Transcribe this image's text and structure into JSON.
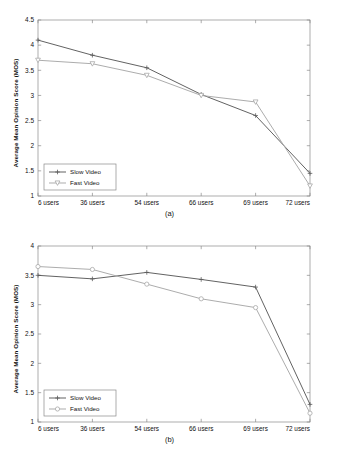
{
  "figure": {
    "background": "#ffffff",
    "width": 339,
    "height": 452
  },
  "chart_data": [
    {
      "type": "line",
      "panel_label": "(a)",
      "title": "",
      "xlabel": "",
      "ylabel": "Average Mean Opinion Score (MOS)",
      "categories": [
        "6 users",
        "36 users",
        "54 users",
        "66 users",
        "69 users",
        "72 users"
      ],
      "ylim": [
        1,
        4.5
      ],
      "yticks": [
        "1",
        "1.5",
        "2",
        "2.5",
        "3",
        "3.5",
        "4",
        "4.5"
      ],
      "ytick_values": [
        1,
        1.5,
        2,
        2.5,
        3,
        3.5,
        4,
        4.5
      ],
      "grid": false,
      "legend_position": "lower left",
      "series": [
        {
          "name": "Slow Video",
          "marker": "plus",
          "color": "#5a5a5a",
          "values": [
            4.1,
            3.8,
            3.55,
            3.02,
            2.6,
            1.45
          ]
        },
        {
          "name": "Fast Video",
          "marker": "triangle-down",
          "color": "#a8a8a8",
          "values": [
            3.7,
            3.63,
            3.4,
            3.0,
            2.87,
            1.2
          ]
        }
      ]
    },
    {
      "type": "line",
      "panel_label": "(b)",
      "title": "",
      "xlabel": "",
      "ylabel": "Average Mean Opinion Score (MOS)",
      "categories": [
        "6 users",
        "36 users",
        "54 users",
        "66 users",
        "69 users",
        "72 users"
      ],
      "ylim": [
        1,
        4
      ],
      "yticks": [
        "1",
        "1.5",
        "2",
        "2.5",
        "3",
        "3.5",
        "4"
      ],
      "ytick_values": [
        1,
        1.5,
        2,
        2.5,
        3,
        3.5,
        4
      ],
      "grid": false,
      "legend_position": "lower left",
      "series": [
        {
          "name": "Slow Video",
          "marker": "plus",
          "color": "#5a5a5a",
          "values": [
            3.5,
            3.44,
            3.55,
            3.43,
            3.3,
            1.3
          ]
        },
        {
          "name": "Fast Video",
          "marker": "circle",
          "color": "#a8a8a8",
          "values": [
            3.65,
            3.6,
            3.35,
            3.1,
            2.95,
            1.15
          ]
        }
      ]
    }
  ]
}
